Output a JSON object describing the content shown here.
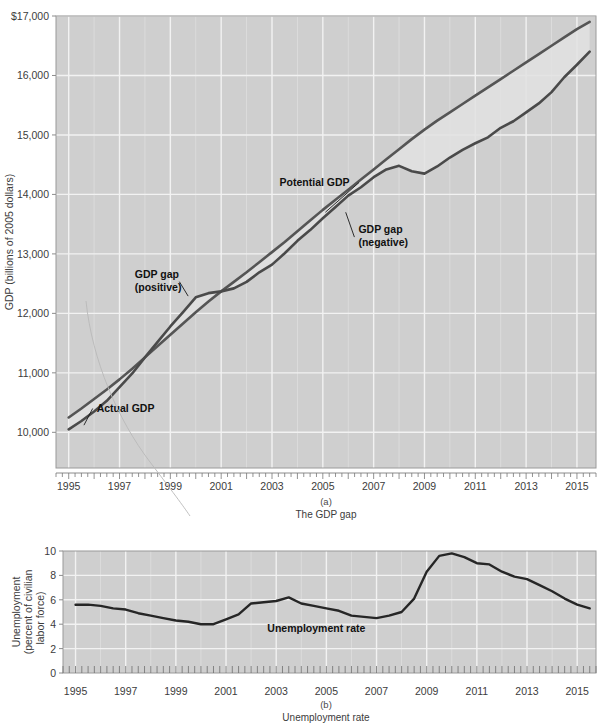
{
  "figure": {
    "top_cropped_text": "",
    "panels": [
      {
        "id": "a",
        "num": "(a)",
        "caption": "The GDP gap"
      },
      {
        "id": "b",
        "num": "(b)",
        "caption": "Unemployment rate"
      }
    ]
  },
  "colors": {
    "plot_background": "#cfcfcf",
    "gridline": "#f2f2f2",
    "actual_gdp_line": "#4a4a4a",
    "potential_gdp_line": "#555555",
    "unemployment_line": "#262626",
    "gap_fill": "#e2e2e2",
    "axis": "#8c8c8c",
    "text": "#3c3c3c",
    "annotation_text": "#111111"
  },
  "chart_data": [
    {
      "type": "line",
      "id": "gdp-gap-chart",
      "title": "The GDP gap",
      "panel_label": "(a)",
      "xlabel": "",
      "ylabel": "GDP (billions of 2005 dollars)",
      "xlim": [
        1994.5,
        2015.75
      ],
      "ylim": [
        9400,
        17000
      ],
      "ytick_labels": [
        "$17,000",
        "16,000",
        "15,000",
        "14,000",
        "13,000",
        "12,000",
        "11,000",
        "10,000"
      ],
      "yticks": [
        17000,
        16000,
        15000,
        14000,
        13000,
        12000,
        11000,
        10000
      ],
      "xticks": [
        1995,
        1997,
        1999,
        2001,
        2003,
        2005,
        2007,
        2009,
        2011,
        2013,
        2015
      ],
      "xtick_labels": [
        "1995",
        "1997",
        "1999",
        "2001",
        "2003",
        "2005",
        "2007",
        "2009",
        "2011",
        "2013",
        "2015"
      ],
      "grid": true,
      "minor_xticks_per_year": 4,
      "legend_position": "inline-annotations",
      "annotations": [
        {
          "text": "Potential GDP",
          "x": 2003.3,
          "y": 14150,
          "leader_to_x": 2005.1,
          "leader_to_y": 13700
        },
        {
          "text": "GDP gap",
          "text2": "(negative)",
          "x": 2006.4,
          "y": 13350,
          "leader_to_x": 2005.9,
          "leader_to_y": 13700
        },
        {
          "text": "GDP gap",
          "text2": "(positive)",
          "x": 1997.6,
          "y": 12600,
          "leader_to_x": 1999.7,
          "leader_to_y": 12290
        },
        {
          "text": "Actual GDP",
          "x": 1996.1,
          "y": 10350,
          "leader_to_x": 1995.6,
          "leader_to_y": 10120
        }
      ],
      "series": [
        {
          "name": "Potential GDP",
          "x": [
            1995.0,
            1995.5,
            1996.0,
            1996.5,
            1997.0,
            1997.5,
            1998.0,
            1998.5,
            1999.0,
            1999.5,
            2000.0,
            2000.5,
            2001.0,
            2001.5,
            2002.0,
            2002.5,
            2003.0,
            2003.5,
            2004.0,
            2004.5,
            2005.0,
            2005.5,
            2006.0,
            2006.5,
            2007.0,
            2007.5,
            2008.0,
            2008.5,
            2009.0,
            2009.5,
            2010.0,
            2010.5,
            2011.0,
            2011.5,
            2012.0,
            2012.5,
            2013.0,
            2013.5,
            2014.0,
            2014.5,
            2015.0,
            2015.5
          ],
          "values": [
            10250,
            10400,
            10560,
            10720,
            10890,
            11070,
            11260,
            11450,
            11640,
            11830,
            12020,
            12200,
            12370,
            12530,
            12690,
            12860,
            13030,
            13200,
            13380,
            13560,
            13740,
            13910,
            14080,
            14250,
            14420,
            14590,
            14760,
            14930,
            15090,
            15240,
            15380,
            15520,
            15660,
            15800,
            15940,
            16080,
            16220,
            16360,
            16500,
            16640,
            16780,
            16900
          ]
        },
        {
          "name": "Actual GDP",
          "x": [
            1995.0,
            1995.5,
            1996.0,
            1996.5,
            1997.0,
            1997.5,
            1998.0,
            1998.5,
            1999.0,
            1999.5,
            2000.0,
            2000.5,
            2001.0,
            2001.5,
            2002.0,
            2002.5,
            2003.0,
            2003.5,
            2004.0,
            2004.5,
            2005.0,
            2005.5,
            2006.0,
            2006.5,
            2007.0,
            2007.5,
            2008.0,
            2008.5,
            2009.0,
            2009.5,
            2010.0,
            2010.5,
            2011.0,
            2011.5,
            2012.0,
            2012.5,
            2013.0,
            2013.5,
            2014.0,
            2014.5,
            2015.0,
            2015.5
          ],
          "values": [
            10050,
            10190,
            10350,
            10530,
            10760,
            10990,
            11260,
            11520,
            11780,
            12020,
            12270,
            12340,
            12370,
            12420,
            12530,
            12690,
            12820,
            13010,
            13220,
            13400,
            13600,
            13790,
            13980,
            14120,
            14290,
            14420,
            14480,
            14390,
            14350,
            14470,
            14620,
            14750,
            14860,
            14960,
            15120,
            15230,
            15380,
            15530,
            15720,
            15970,
            16180,
            16400
          ]
        }
      ]
    },
    {
      "type": "line",
      "id": "unemployment-chart",
      "title": "Unemployment rate",
      "panel_label": "(b)",
      "xlabel": "",
      "ylabel": "Unemployment (percent of civilian labor force)",
      "xlim": [
        1994.5,
        2015.75
      ],
      "ylim": [
        0,
        10
      ],
      "yticks": [
        0,
        2,
        4,
        6,
        8,
        10
      ],
      "ytick_labels": [
        "0",
        "2",
        "4",
        "6",
        "8",
        "10"
      ],
      "xticks": [
        1995,
        1997,
        1999,
        2001,
        2003,
        2005,
        2007,
        2009,
        2011,
        2013,
        2015
      ],
      "xtick_labels": [
        "1995",
        "1997",
        "1999",
        "2001",
        "2003",
        "2005",
        "2007",
        "2009",
        "2011",
        "2013",
        "2015"
      ],
      "grid": true,
      "minor_xticks_per_year": 4,
      "annotations": [
        {
          "text": "Unemployment rate",
          "x": 2004.6,
          "y": 3.4
        }
      ],
      "series": [
        {
          "name": "Unemployment rate",
          "x": [
            1995.0,
            1995.5,
            1996.0,
            1996.5,
            1997.0,
            1997.5,
            1998.0,
            1998.5,
            1999.0,
            1999.5,
            2000.0,
            2000.5,
            2001.0,
            2001.5,
            2002.0,
            2002.5,
            2003.0,
            2003.5,
            2004.0,
            2004.5,
            2005.0,
            2005.5,
            2006.0,
            2006.5,
            2007.0,
            2007.5,
            2008.0,
            2008.5,
            2009.0,
            2009.5,
            2010.0,
            2010.5,
            2011.0,
            2011.5,
            2012.0,
            2012.5,
            2013.0,
            2013.5,
            2014.0,
            2014.5,
            2015.0,
            2015.5
          ],
          "values": [
            5.6,
            5.6,
            5.5,
            5.3,
            5.2,
            4.9,
            4.7,
            4.5,
            4.3,
            4.2,
            4.0,
            4.0,
            4.4,
            4.8,
            5.7,
            5.8,
            5.9,
            6.2,
            5.7,
            5.5,
            5.3,
            5.1,
            4.7,
            4.6,
            4.5,
            4.7,
            5.0,
            6.1,
            8.3,
            9.6,
            9.8,
            9.5,
            9.0,
            8.9,
            8.3,
            7.9,
            7.7,
            7.2,
            6.7,
            6.1,
            5.6,
            5.3
          ]
        }
      ]
    }
  ]
}
